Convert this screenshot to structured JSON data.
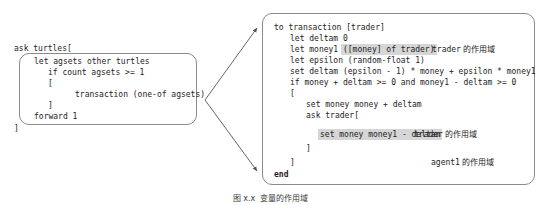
{
  "figure": {
    "caption": "图 x.x  变量的作用域"
  },
  "left_block": {
    "name": "ask-turtles-block",
    "header_line": "ask turtles[",
    "footer_line": "]",
    "box_lines": [
      "    let agsets other turtles",
      "        if count agsets >= 1",
      "        [",
      "                transaction (one-of agsets)",
      "        ]",
      "    forward 1"
    ]
  },
  "right_block": {
    "name": "transaction-procedure-block",
    "lines": [
      {
        "indent": 0,
        "bold_prefix": "to",
        "rest": " transaction [trader]"
      },
      {
        "indent": 1,
        "text": "let deltam 0"
      },
      {
        "indent": 1,
        "pre": "let money1 ",
        "highlight": "([money] of trader)"
      },
      {
        "indent": 1,
        "text": "let epsilon (random-float 1)"
      },
      {
        "indent": 1,
        "text": "set deltam (epsilon - 1) * money + epsilon * money1"
      },
      {
        "indent": 1,
        "text": "if money + deltam >= 0 and money1 - deltam >= 0"
      },
      {
        "indent": 1,
        "text": "["
      },
      {
        "indent": 2,
        "text": "set money money + deltam"
      },
      {
        "indent": 2,
        "text": "ask trader["
      },
      {
        "indent": 3,
        "highlight": "set money money1 - deltam"
      },
      {
        "indent": 2,
        "text": "]"
      },
      {
        "indent": 1,
        "text": "]"
      },
      {
        "indent": 0,
        "bold_prefix": "end",
        "rest": ""
      }
    ],
    "annotations": [
      {
        "label_mono": "trader",
        "label_cn": " 的作用域"
      },
      {
        "label_mono": "trader",
        "label_cn": " 的作用域"
      },
      {
        "label_mono": "agent1",
        "label_cn": " 的作用域"
      }
    ]
  },
  "code_text": {
    "l_header": "ask turtles[",
    "l_1": "let agsets other turtles",
    "l_2": "if count agsets >= 1",
    "l_3": "[",
    "l_4": "transaction (one-of agsets)",
    "l_5": "]",
    "l_6": "forward 1",
    "l_footer": "]",
    "r_0a": "to",
    "r_0b": " transaction [trader]",
    "r_1": "let deltam 0",
    "r_2a": "let money1 ",
    "r_2b": "([money] of trader)",
    "r_3": "let epsilon (random-float 1)",
    "r_4": "set deltam (epsilon - 1) * money + epsilon * money1",
    "r_5": "if money + deltam >= 0 and money1 - deltam >= 0",
    "r_6": "[",
    "r_7": "set money money + deltam",
    "r_8": "ask trader[",
    "r_9": "set money money1 - deltam",
    "r_10": "]",
    "r_11": "]",
    "r_12": "end",
    "ann_1_mono": "trader",
    "ann_1_cn": " 的作用域",
    "ann_2_mono": "trader",
    "ann_2_cn": " 的作用域",
    "ann_3_mono": "agent1",
    "ann_3_cn": " 的作用域"
  },
  "colors": {
    "box_border": "#8a8a8a",
    "highlight": "#d6d6d6",
    "text": "#1c1c1c",
    "arrow": "#555555"
  },
  "arrows": [
    {
      "name": "arrow-to-top",
      "from_x": 205,
      "from_y": 100,
      "to_x": 258,
      "to_y": 27
    },
    {
      "name": "arrow-to-bottom",
      "from_x": 205,
      "from_y": 100,
      "to_x": 258,
      "to_y": 172
    }
  ]
}
